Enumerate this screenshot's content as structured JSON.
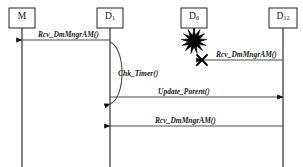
{
  "diagram": {
    "kind": "uml-sequence-diagram",
    "title": "",
    "background_color": "#ffffff",
    "line_color": "#4d4d4d",
    "text_color": "#1a1a1a",
    "accent_color": "#000000",
    "participants": [
      {
        "id": "m",
        "name": "M",
        "base": "M",
        "subscript": "",
        "x": 22,
        "box_w": 26,
        "box_h": 20,
        "lifeline_end": 167,
        "destroyed": false
      },
      {
        "id": "d1",
        "name": "D1",
        "base": "D",
        "subscript": "1",
        "x": 110,
        "box_w": 26,
        "box_h": 20,
        "lifeline_end": 167,
        "destroyed": false
      },
      {
        "id": "d6",
        "name": "D6",
        "base": "D",
        "subscript": "6",
        "x": 194,
        "box_w": 26,
        "box_h": 20,
        "lifeline_end": 32,
        "destroyed": true
      },
      {
        "id": "d12",
        "name": "D12",
        "base": "D",
        "subscript": "12",
        "x": 283,
        "box_w": 28,
        "box_h": 20,
        "lifeline_end": 167,
        "destroyed": false
      }
    ],
    "messages": [
      {
        "id": "msg1",
        "label": "Rcv_DmMngrAM()",
        "from": "d1",
        "to": "m",
        "y": 40,
        "direction": "left",
        "lost": false,
        "label_x": 38,
        "label_y": 30
      },
      {
        "id": "msg2",
        "label": "Rcv_DmMngrAM()",
        "from": "d12",
        "to": "d6",
        "y": 60,
        "direction": "left",
        "lost": true,
        "label_x": 216,
        "label_y": 50
      },
      {
        "id": "msg3",
        "label": "Update_Parent()",
        "from": "d1",
        "to": "d12",
        "y": 97,
        "direction": "right",
        "lost": false,
        "label_x": 158,
        "label_y": 87
      },
      {
        "id": "msg4",
        "label": "Rcv_DmMngrAM()",
        "from": "d12",
        "to": "d1",
        "y": 126,
        "direction": "left",
        "lost": false,
        "label_x": 155,
        "label_y": 116
      }
    ],
    "self_calls": [
      {
        "id": "self1",
        "label": "Chk_Timer()",
        "on": "d1",
        "y_start": 42,
        "y_end": 104,
        "bulge": 16,
        "label_x": 118,
        "label_y": 69
      }
    ],
    "failure_marker": {
      "id": "explosion-d6",
      "shape": "starburst",
      "on": "d6",
      "cx": 194,
      "cy": 41,
      "radius_outer": 13,
      "radius_inner": 6,
      "points": 13,
      "color": "#000000"
    },
    "lost_marker": {
      "id": "lost-x-msg2",
      "shape": "x-cross",
      "x": 202,
      "y": 60,
      "size": 5,
      "color": "#000000"
    }
  }
}
